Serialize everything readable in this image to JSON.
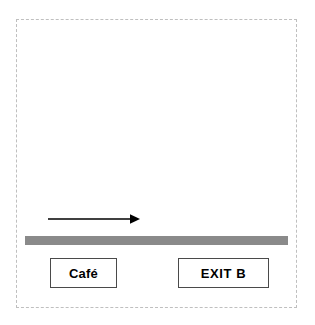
{
  "scene": {
    "title": "Corridor wayfinding diagram",
    "background_color": "#ffffff",
    "width": 315,
    "height": 325
  },
  "frame": {
    "name": "diagram-boundary",
    "style": "dashed",
    "color": "#bfbfbf"
  },
  "arrow": {
    "name": "direction-arrow",
    "direction": "right",
    "color": "#000000",
    "label": ""
  },
  "corridor": {
    "name": "corridor-band",
    "color": "#8a8a8a",
    "label": ""
  },
  "signs": [
    {
      "id": "cafe",
      "label": "Café",
      "border_color": "#4a4a4a",
      "background_color": "#ffffff",
      "text_color": "#000000"
    },
    {
      "id": "exit-b",
      "label": "EXIT B",
      "border_color": "#4a4a4a",
      "background_color": "#ffffff",
      "text_color": "#000000"
    }
  ]
}
